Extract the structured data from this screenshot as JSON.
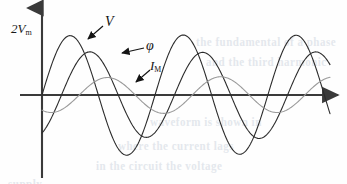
{
  "figure": {
    "title_visible": false,
    "background_color": "#fefefe",
    "ink_color": "#2b2b2b",
    "axis_color": "#3a3a3a",
    "faint_color": "#8d8d8d"
  },
  "axes": {
    "origin": {
      "x": 42,
      "y": 95
    },
    "x_axis": {
      "start_x": 20,
      "end_x": 338,
      "y": 95,
      "arrow": "right-arrow",
      "label": ""
    },
    "y_axis": {
      "x": 42,
      "top_y": 8,
      "bottom_y": 178,
      "arrow": "up-arrow",
      "label": ""
    },
    "y_axis_label": {
      "text": "2V",
      "subscript": "m",
      "x": 11,
      "y": 30
    }
  },
  "labels": [
    {
      "name": "v-label",
      "text": "V",
      "subscript": "",
      "x": 105,
      "y": 14,
      "arrow_from": [
        103,
        26
      ],
      "arrow_to": [
        88,
        39
      ]
    },
    {
      "name": "phi-label",
      "text": "φ",
      "subscript": "",
      "x": 146,
      "y": 38,
      "arrow_from": [
        144,
        48
      ],
      "arrow_to": [
        122,
        53
      ]
    },
    {
      "name": "im-label",
      "text": "I",
      "subscript": "M",
      "x": 150,
      "y": 58,
      "arrow_from": [
        150,
        70
      ],
      "arrow_to": [
        136,
        82
      ]
    }
  ],
  "chart_data": {
    "type": "line",
    "title": "",
    "xlabel": "",
    "ylabel": "2V_m",
    "xlim": [
      0,
      3.1
    ],
    "ylim": [
      -1.15,
      1.15
    ],
    "grid": false,
    "legend": "inline-annotations",
    "x_unit": "cycles",
    "series": [
      {
        "name": "V",
        "label": "V",
        "color": "#2b2b2b",
        "stroke_width": 1.1,
        "amplitude": 60,
        "cycles": 2.55,
        "phase_deg": 0,
        "y_offset": 0,
        "peak_points": [
          [
            82,
            35
          ],
          [
            206,
            35
          ]
        ],
        "trough_points": [
          [
            144,
            155
          ],
          [
            268,
            155
          ]
        ]
      },
      {
        "name": "phi",
        "label": "φ",
        "color": "#2b2b2b",
        "stroke_width": 1.1,
        "amplitude": 43,
        "cycles": 2.55,
        "phase_deg": -62,
        "y_offset": 0,
        "peak_points": [
          [
            118,
            52
          ],
          [
            240,
            52
          ]
        ],
        "trough_points": [
          [
            180,
            138
          ],
          [
            302,
            138
          ]
        ]
      },
      {
        "name": "I_M",
        "label": "I_M",
        "color": "#9a9a9a",
        "stroke_width": 1.1,
        "amplitude": 18,
        "cycles": 2.55,
        "phase_deg": -118,
        "y_offset": 0,
        "peak_points": [
          [
            148,
            77
          ],
          [
            270,
            77
          ]
        ],
        "trough_points": [
          [
            87,
            113
          ],
          [
            209,
            113
          ]
        ]
      }
    ]
  },
  "background_artifacts": {
    "description": "faint bluish show-through text from reverse of scanned page",
    "lines": [
      {
        "text": "the fundamental of a phase",
        "x": 196,
        "y": 36,
        "size": 11
      },
      {
        "text": "and the third harmonic",
        "x": 206,
        "y": 56,
        "size": 11
      },
      {
        "text": "waveform is shown in",
        "x": 150,
        "y": 116,
        "size": 11
      },
      {
        "text": "where the current lags",
        "x": 118,
        "y": 140,
        "size": 11
      },
      {
        "text": "in the circuit the voltage",
        "x": 96,
        "y": 160,
        "size": 11
      },
      {
        "text": "supply",
        "x": 8,
        "y": 178,
        "size": 11
      }
    ]
  }
}
